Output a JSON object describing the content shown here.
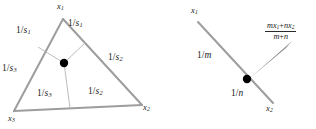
{
  "figure": {
    "background_color": "#ffffff",
    "edge_color": "#999999",
    "thin_line_color": "#b0b0b0",
    "dot_color": "#000000",
    "text_color": "#1a1a1a"
  },
  "left_diagram": {
    "name": "triangle-with-interior-point",
    "vertices": [
      {
        "id": "v1",
        "label_main": "x",
        "label_sub": "1",
        "x": 57,
        "y": 7
      },
      {
        "id": "v2",
        "label_main": "x",
        "label_sub": "2",
        "x": 143,
        "y": 107
      },
      {
        "id": "v3",
        "label_main": "x",
        "label_sub": "3",
        "x": 10,
        "y": 118
      }
    ],
    "interior_point": {
      "cx": 64,
      "cy": 63,
      "r": 4.2
    },
    "edge_labels": [
      {
        "id": "upper-left",
        "num": "1",
        "den_main": "s",
        "den_sub": "1",
        "x": 16,
        "y": 28
      },
      {
        "id": "upper-right",
        "num": "1",
        "den_main": "s",
        "den_sub": "1",
        "x": 68,
        "y": 21
      },
      {
        "id": "left",
        "num": "1",
        "den_main": "s",
        "den_sub": "3",
        "x": 2,
        "y": 65
      },
      {
        "id": "right",
        "num": "1",
        "den_main": "s",
        "den_sub": "2",
        "x": 108,
        "y": 55
      },
      {
        "id": "bottom-left",
        "num": "1",
        "den_main": "s",
        "den_sub": "3",
        "x": 38,
        "y": 91
      },
      {
        "id": "bottom-right",
        "num": "1",
        "den_main": "s",
        "den_sub": "2",
        "x": 89,
        "y": 89
      }
    ]
  },
  "right_diagram": {
    "name": "segment-with-dividing-point",
    "endpoints": [
      {
        "id": "p1",
        "label_main": "x",
        "label_sub": "1",
        "x": 192,
        "y": 10
      },
      {
        "id": "p2",
        "label_main": "x",
        "label_sub": "2",
        "x": 266,
        "y": 108
      }
    ],
    "interior_point": {
      "cx": 247,
      "cy": 79,
      "r": 4.2
    },
    "segment_labels": [
      {
        "id": "upper",
        "num": "1",
        "den_main": "m",
        "den_sub": "",
        "x": 198,
        "y": 52
      },
      {
        "id": "lower",
        "num": "1",
        "den_main": "n",
        "den_sub": "",
        "x": 232,
        "y": 90
      }
    ],
    "callout_formula": {
      "numerator_parts": [
        {
          "italic": "m",
          "sub": ""
        },
        {
          "italic": "x",
          "sub": "1"
        },
        {
          "op": "+"
        },
        {
          "italic": "n",
          "sub": ""
        },
        {
          "italic": "x",
          "sub": "2"
        }
      ],
      "numerator_text": "mx₁ + nx₂",
      "denominator_text": "m + n",
      "x": 266,
      "y": 20
    },
    "pointer": {
      "from_x": 290,
      "from_y": 43,
      "to_x": 252,
      "to_y": 78
    }
  }
}
